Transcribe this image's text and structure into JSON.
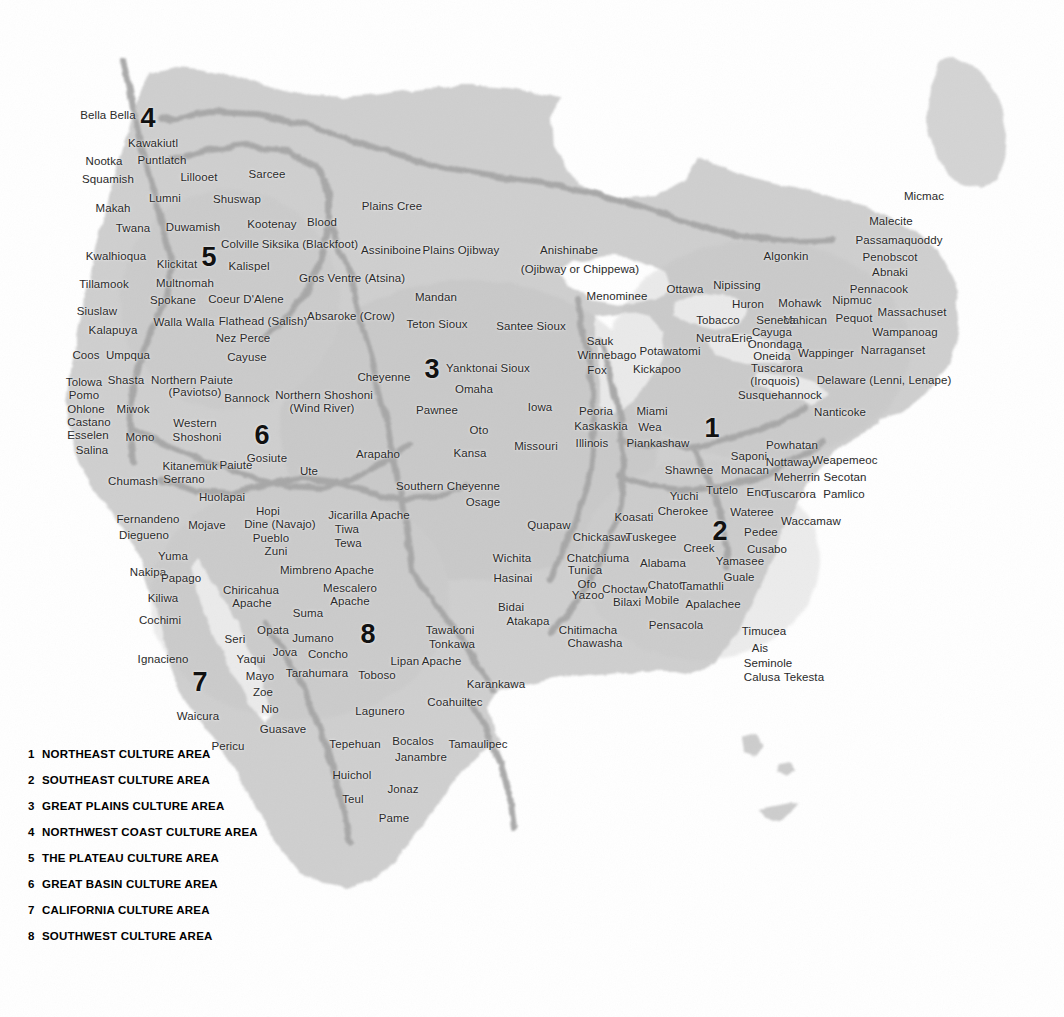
{
  "map": {
    "title": "Native American Culture Areas of North America",
    "colors": {
      "land": "#c9c9c9",
      "land_light": "#dcdcdc",
      "border": "#9e9e9e",
      "water": "#ffffff",
      "label": "#2a2a2a",
      "legend_text": "#000000"
    }
  },
  "legend": {
    "items": [
      {
        "num": "1",
        "label": "NORTHEAST CULTURE AREA"
      },
      {
        "num": "2",
        "label": "SOUTHEAST CULTURE AREA"
      },
      {
        "num": "3",
        "label": "GREAT PLAINS CULTURE AREA"
      },
      {
        "num": "4",
        "label": "NORTHWEST COAST CULTURE AREA"
      },
      {
        "num": "5",
        "label": "THE PLATEAU CULTURE AREA"
      },
      {
        "num": "6",
        "label": "GREAT BASIN CULTURE AREA"
      },
      {
        "num": "7",
        "label": "CALIFORNIA CULTURE AREA"
      },
      {
        "num": "8",
        "label": "SOUTHWEST CULTURE AREA"
      }
    ]
  },
  "area_numbers": [
    {
      "num": "1",
      "x": 712,
      "y": 428
    },
    {
      "num": "2",
      "x": 720,
      "y": 531
    },
    {
      "num": "3",
      "x": 432,
      "y": 369
    },
    {
      "num": "4",
      "x": 148,
      "y": 118
    },
    {
      "num": "5",
      "x": 209,
      "y": 257
    },
    {
      "num": "6",
      "x": 262,
      "y": 435
    },
    {
      "num": "7",
      "x": 200,
      "y": 682
    },
    {
      "num": "8",
      "x": 368,
      "y": 634
    }
  ],
  "tribes": [
    {
      "name": "Bella Bella",
      "x": 108,
      "y": 115
    },
    {
      "name": "Kawakiutl",
      "x": 153,
      "y": 143
    },
    {
      "name": "Nootka",
      "x": 104,
      "y": 161
    },
    {
      "name": "Puntlatch",
      "x": 162,
      "y": 160
    },
    {
      "name": "Squamish",
      "x": 108,
      "y": 179
    },
    {
      "name": "Lillooet",
      "x": 199,
      "y": 177
    },
    {
      "name": "Sarcee",
      "x": 267,
      "y": 174
    },
    {
      "name": "Lumni",
      "x": 165,
      "y": 198
    },
    {
      "name": "Shuswap",
      "x": 237,
      "y": 199
    },
    {
      "name": "Makah",
      "x": 113,
      "y": 208
    },
    {
      "name": "Plains Cree",
      "x": 392,
      "y": 206
    },
    {
      "name": "Twana",
      "x": 133,
      "y": 228
    },
    {
      "name": "Duwamish",
      "x": 193,
      "y": 227
    },
    {
      "name": "Kootenay",
      "x": 272,
      "y": 224
    },
    {
      "name": "Blood",
      "x": 322,
      "y": 222
    },
    {
      "name": "Micmac",
      "x": 924,
      "y": 196
    },
    {
      "name": "Malecite",
      "x": 891,
      "y": 221
    },
    {
      "name": "Kwalhioqua",
      "x": 116,
      "y": 256
    },
    {
      "name": "Klickitat",
      "x": 177,
      "y": 264
    },
    {
      "name": "Colville",
      "x": 240,
      "y": 244
    },
    {
      "name": "Siksika (Blackfoot)",
      "x": 310,
      "y": 244
    },
    {
      "name": "Assiniboine",
      "x": 391,
      "y": 250
    },
    {
      "name": "Plains Ojibway",
      "x": 461,
      "y": 250
    },
    {
      "name": "Anishinabe",
      "x": 569,
      "y": 250
    },
    {
      "name": "Algonkin",
      "x": 786,
      "y": 256
    },
    {
      "name": "Passamaquoddy",
      "x": 899,
      "y": 240
    },
    {
      "name": "Penobscot",
      "x": 890,
      "y": 257
    },
    {
      "name": "Kalispel",
      "x": 249,
      "y": 266
    },
    {
      "name": "(Ojibway or Chippewa)",
      "x": 580,
      "y": 269
    },
    {
      "name": "Abnaki",
      "x": 890,
      "y": 272
    },
    {
      "name": "Tillamook",
      "x": 104,
      "y": 284
    },
    {
      "name": "Multnomah",
      "x": 185,
      "y": 283
    },
    {
      "name": "Gros Ventre (Atsina)",
      "x": 352,
      "y": 278
    },
    {
      "name": "Ottawa",
      "x": 685,
      "y": 289
    },
    {
      "name": "Nipissing",
      "x": 737,
      "y": 285
    },
    {
      "name": "Pennacook",
      "x": 879,
      "y": 289
    },
    {
      "name": "Spokane",
      "x": 173,
      "y": 300
    },
    {
      "name": "Coeur D'Alene",
      "x": 246,
      "y": 299
    },
    {
      "name": "Menominee",
      "x": 617,
      "y": 296
    },
    {
      "name": "Huron",
      "x": 748,
      "y": 304
    },
    {
      "name": "Mohawk",
      "x": 800,
      "y": 303
    },
    {
      "name": "Nipmuc",
      "x": 852,
      "y": 300
    },
    {
      "name": "Siuslaw",
      "x": 97,
      "y": 311
    },
    {
      "name": "Mandan",
      "x": 436,
      "y": 297
    },
    {
      "name": "Tobacco",
      "x": 718,
      "y": 320
    },
    {
      "name": "Mahican",
      "x": 805,
      "y": 320
    },
    {
      "name": "Pequot",
      "x": 854,
      "y": 318
    },
    {
      "name": "Massachuset",
      "x": 912,
      "y": 312
    },
    {
      "name": "Walla Walla",
      "x": 184,
      "y": 322
    },
    {
      "name": "Flathead (Salish)",
      "x": 263,
      "y": 321
    },
    {
      "name": "Absaroke (Crow)",
      "x": 351,
      "y": 316
    },
    {
      "name": "Teton Sioux",
      "x": 437,
      "y": 324
    },
    {
      "name": "Santee Sioux",
      "x": 531,
      "y": 326
    },
    {
      "name": "Neutral",
      "x": 715,
      "y": 338
    },
    {
      "name": "Erie",
      "x": 742,
      "y": 338
    },
    {
      "name": "Cayuga",
      "x": 772,
      "y": 332
    },
    {
      "name": "Kalapuya",
      "x": 113,
      "y": 330
    },
    {
      "name": "Nez Perce",
      "x": 243,
      "y": 338
    },
    {
      "name": "Sauk",
      "x": 600,
      "y": 341
    },
    {
      "name": "Seneca",
      "x": 776,
      "y": 320
    },
    {
      "name": "Wampanoag",
      "x": 905,
      "y": 332
    },
    {
      "name": "Coos",
      "x": 86,
      "y": 355
    },
    {
      "name": "Umpqua",
      "x": 128,
      "y": 355
    },
    {
      "name": "Cayuse",
      "x": 247,
      "y": 357
    },
    {
      "name": "Potawatomi",
      "x": 670,
      "y": 351
    },
    {
      "name": "Onondaga",
      "x": 775,
      "y": 344
    },
    {
      "name": "Wappinger",
      "x": 826,
      "y": 353
    },
    {
      "name": "Narraganset",
      "x": 893,
      "y": 350
    },
    {
      "name": "Winnebago",
      "x": 607,
      "y": 355
    },
    {
      "name": "Cheyenne",
      "x": 384,
      "y": 377
    },
    {
      "name": "Yanktonai Sioux",
      "x": 488,
      "y": 368
    },
    {
      "name": "Oneida",
      "x": 772,
      "y": 356
    },
    {
      "name": "Tolowa",
      "x": 84,
      "y": 382
    },
    {
      "name": "Shasta",
      "x": 126,
      "y": 380
    },
    {
      "name": "Northern Paiute",
      "x": 192,
      "y": 380
    },
    {
      "name": "Fox",
      "x": 597,
      "y": 370
    },
    {
      "name": "Tuscarora",
      "x": 777,
      "y": 368
    },
    {
      "name": "Delaware (Lenni, Lenape)",
      "x": 884,
      "y": 380
    },
    {
      "name": "Pomo",
      "x": 84,
      "y": 395
    },
    {
      "name": "(Paviotso)",
      "x": 195,
      "y": 392
    },
    {
      "name": "Omaha",
      "x": 474,
      "y": 389
    },
    {
      "name": "Kickapoo",
      "x": 657,
      "y": 369
    },
    {
      "name": "(Iroquois)",
      "x": 775,
      "y": 381
    },
    {
      "name": "Ohlone",
      "x": 86,
      "y": 409
    },
    {
      "name": "Miwok",
      "x": 133,
      "y": 409
    },
    {
      "name": "Bannock",
      "x": 247,
      "y": 398
    },
    {
      "name": "Northern Shoshoni",
      "x": 324,
      "y": 395
    },
    {
      "name": "Susquehannock",
      "x": 780,
      "y": 395
    },
    {
      "name": "Nanticoke",
      "x": 840,
      "y": 412
    },
    {
      "name": "Castano",
      "x": 89,
      "y": 422
    },
    {
      "name": "(Wind River)",
      "x": 322,
      "y": 408
    },
    {
      "name": "Pawnee",
      "x": 437,
      "y": 410
    },
    {
      "name": "Iowa",
      "x": 540,
      "y": 407
    },
    {
      "name": "Peoria",
      "x": 596,
      "y": 411
    },
    {
      "name": "Miami",
      "x": 652,
      "y": 411
    },
    {
      "name": "Esselen",
      "x": 88,
      "y": 435
    },
    {
      "name": "Mono",
      "x": 140,
      "y": 437
    },
    {
      "name": "Western",
      "x": 195,
      "y": 423
    },
    {
      "name": "Shoshoni",
      "x": 197,
      "y": 437
    },
    {
      "name": "Oto",
      "x": 479,
      "y": 430
    },
    {
      "name": "Kaskaskia",
      "x": 601,
      "y": 426
    },
    {
      "name": "Wea",
      "x": 650,
      "y": 427
    },
    {
      "name": "Powhatan",
      "x": 792,
      "y": 445
    },
    {
      "name": "Salina",
      "x": 92,
      "y": 450
    },
    {
      "name": "Kansa",
      "x": 470,
      "y": 453
    },
    {
      "name": "Missouri",
      "x": 536,
      "y": 446
    },
    {
      "name": "Illinois",
      "x": 592,
      "y": 443
    },
    {
      "name": "Piankashaw",
      "x": 658,
      "y": 443
    },
    {
      "name": "Gosiute",
      "x": 267,
      "y": 458
    },
    {
      "name": "Saponi",
      "x": 749,
      "y": 456
    },
    {
      "name": "Nottaway",
      "x": 790,
      "y": 462
    },
    {
      "name": "Weapemeoc",
      "x": 845,
      "y": 460
    },
    {
      "name": "Kitanemuk",
      "x": 190,
      "y": 466
    },
    {
      "name": "Paiute",
      "x": 236,
      "y": 465
    },
    {
      "name": "Ute",
      "x": 309,
      "y": 471
    },
    {
      "name": "Arapaho",
      "x": 378,
      "y": 454
    },
    {
      "name": "Monacan",
      "x": 745,
      "y": 470
    },
    {
      "name": "Meherrin",
      "x": 797,
      "y": 477
    },
    {
      "name": "Secotan",
      "x": 845,
      "y": 477
    },
    {
      "name": "Serrano",
      "x": 184,
      "y": 479
    },
    {
      "name": "Chumash",
      "x": 133,
      "y": 481
    },
    {
      "name": "Southern Cheyenne",
      "x": 448,
      "y": 486
    },
    {
      "name": "Shawnee",
      "x": 689,
      "y": 470
    },
    {
      "name": "Yuchi",
      "x": 684,
      "y": 496
    },
    {
      "name": "Tutelo",
      "x": 722,
      "y": 490
    },
    {
      "name": "Eno",
      "x": 757,
      "y": 492
    },
    {
      "name": "Tuscarora",
      "x": 790,
      "y": 494
    },
    {
      "name": "Pamlico",
      "x": 844,
      "y": 494
    },
    {
      "name": "Huolapai",
      "x": 222,
      "y": 497
    },
    {
      "name": "Osage",
      "x": 483,
      "y": 502
    },
    {
      "name": "Cherokee",
      "x": 683,
      "y": 511
    },
    {
      "name": "Koasati",
      "x": 634,
      "y": 517
    },
    {
      "name": "Wateree",
      "x": 752,
      "y": 512
    },
    {
      "name": "Waccamaw",
      "x": 811,
      "y": 521
    },
    {
      "name": "Fernandeno",
      "x": 148,
      "y": 519
    },
    {
      "name": "Hopi",
      "x": 268,
      "y": 511
    },
    {
      "name": "Jicarilla Apache",
      "x": 369,
      "y": 515
    },
    {
      "name": "Quapaw",
      "x": 549,
      "y": 525
    },
    {
      "name": "Mojave",
      "x": 207,
      "y": 525
    },
    {
      "name": "Dine (Navajo)",
      "x": 280,
      "y": 524
    },
    {
      "name": "Tiwa",
      "x": 347,
      "y": 529
    },
    {
      "name": "Pedee",
      "x": 761,
      "y": 532
    },
    {
      "name": "Diegueno",
      "x": 144,
      "y": 535
    },
    {
      "name": "Pueblo",
      "x": 271,
      "y": 538
    },
    {
      "name": "Tewa",
      "x": 348,
      "y": 543
    },
    {
      "name": "Chickasaw",
      "x": 601,
      "y": 537
    },
    {
      "name": "Tuskegee",
      "x": 651,
      "y": 537
    },
    {
      "name": "Creek",
      "x": 699,
      "y": 548
    },
    {
      "name": "Cusabo",
      "x": 767,
      "y": 549
    },
    {
      "name": "Zuni",
      "x": 276,
      "y": 551
    },
    {
      "name": "Wichita",
      "x": 512,
      "y": 558
    },
    {
      "name": "Yuma",
      "x": 173,
      "y": 556
    },
    {
      "name": "Chatchiuma",
      "x": 598,
      "y": 558
    },
    {
      "name": "Alabama",
      "x": 663,
      "y": 563
    },
    {
      "name": "Yamasee",
      "x": 740,
      "y": 561
    },
    {
      "name": "Nakipa",
      "x": 148,
      "y": 572
    },
    {
      "name": "Papago",
      "x": 181,
      "y": 578
    },
    {
      "name": "Mimbreno Apache",
      "x": 327,
      "y": 570
    },
    {
      "name": "Tunica",
      "x": 585,
      "y": 570
    },
    {
      "name": "Guale",
      "x": 739,
      "y": 577
    },
    {
      "name": "Kiliwa",
      "x": 163,
      "y": 598
    },
    {
      "name": "Chiricahua",
      "x": 251,
      "y": 590
    },
    {
      "name": "Mescalero",
      "x": 350,
      "y": 588
    },
    {
      "name": "Hasinai",
      "x": 513,
      "y": 578
    },
    {
      "name": "Ofo",
      "x": 587,
      "y": 584
    },
    {
      "name": "Choctaw",
      "x": 625,
      "y": 589
    },
    {
      "name": "Chatot",
      "x": 665,
      "y": 585
    },
    {
      "name": "Tamathli",
      "x": 702,
      "y": 586
    },
    {
      "name": "Apache",
      "x": 252,
      "y": 603
    },
    {
      "name": "Apache",
      "x": 350,
      "y": 601
    },
    {
      "name": "Suma",
      "x": 308,
      "y": 613
    },
    {
      "name": "Yazoo",
      "x": 588,
      "y": 595
    },
    {
      "name": "Bilaxi",
      "x": 627,
      "y": 602
    },
    {
      "name": "Mobile",
      "x": 662,
      "y": 600
    },
    {
      "name": "Apalachee",
      "x": 713,
      "y": 604
    },
    {
      "name": "Cochimi",
      "x": 160,
      "y": 620
    },
    {
      "name": "Opata",
      "x": 273,
      "y": 630
    },
    {
      "name": "Bidai",
      "x": 511,
      "y": 607
    },
    {
      "name": "Atakapa",
      "x": 528,
      "y": 621
    },
    {
      "name": "Chitimacha",
      "x": 588,
      "y": 630
    },
    {
      "name": "Pensacola",
      "x": 676,
      "y": 625
    },
    {
      "name": "Timucea",
      "x": 764,
      "y": 631
    },
    {
      "name": "Seri",
      "x": 235,
      "y": 639
    },
    {
      "name": "Jumano",
      "x": 313,
      "y": 638
    },
    {
      "name": "Tawakoni",
      "x": 450,
      "y": 630
    },
    {
      "name": "Chawasha",
      "x": 595,
      "y": 643
    },
    {
      "name": "Ais",
      "x": 760,
      "y": 648
    },
    {
      "name": "Ignacieno",
      "x": 163,
      "y": 659
    },
    {
      "name": "Yaqui",
      "x": 251,
      "y": 659
    },
    {
      "name": "Jova",
      "x": 285,
      "y": 652
    },
    {
      "name": "Concho",
      "x": 328,
      "y": 654
    },
    {
      "name": "Tonkawa",
      "x": 452,
      "y": 644
    },
    {
      "name": "Lipan Apache",
      "x": 426,
      "y": 661
    },
    {
      "name": "Seminole",
      "x": 768,
      "y": 663
    },
    {
      "name": "Mayo",
      "x": 260,
      "y": 676
    },
    {
      "name": "Tarahumara",
      "x": 317,
      "y": 673
    },
    {
      "name": "Toboso",
      "x": 377,
      "y": 675
    },
    {
      "name": "Calusa",
      "x": 762,
      "y": 677
    },
    {
      "name": "Tekesta",
      "x": 804,
      "y": 677
    },
    {
      "name": "Karankawa",
      "x": 496,
      "y": 684
    },
    {
      "name": "Zoe",
      "x": 263,
      "y": 692
    },
    {
      "name": "Waicura",
      "x": 198,
      "y": 716
    },
    {
      "name": "Nio",
      "x": 270,
      "y": 709
    },
    {
      "name": "Lagunero",
      "x": 380,
      "y": 711
    },
    {
      "name": "Coahuiltec",
      "x": 455,
      "y": 702
    },
    {
      "name": "Guasave",
      "x": 283,
      "y": 729
    },
    {
      "name": "Pericu",
      "x": 228,
      "y": 746
    },
    {
      "name": "Tepehuan",
      "x": 355,
      "y": 744
    },
    {
      "name": "Bocalos",
      "x": 413,
      "y": 741
    },
    {
      "name": "Tamaulipec",
      "x": 478,
      "y": 744
    },
    {
      "name": "Janambre",
      "x": 421,
      "y": 757
    },
    {
      "name": "Huichol",
      "x": 352,
      "y": 775
    },
    {
      "name": "Jonaz",
      "x": 403,
      "y": 789
    },
    {
      "name": "Teul",
      "x": 353,
      "y": 799
    },
    {
      "name": "Pame",
      "x": 394,
      "y": 818
    }
  ]
}
